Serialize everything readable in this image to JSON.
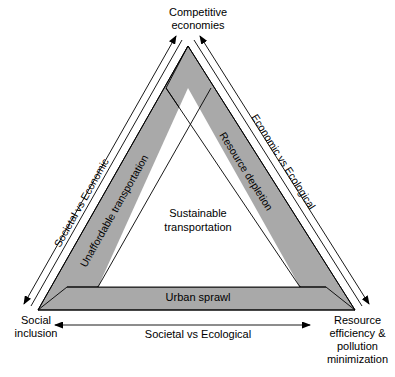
{
  "figure": {
    "type": "diagram",
    "subtype": "sustainability-triangle",
    "background_color": "#ffffff",
    "band_fill_color": "#a9a9a9",
    "line_color": "#000000"
  },
  "corners": {
    "top": {
      "name": "competitive-economies",
      "label": "Competitive\neconomies"
    },
    "bottom_left": {
      "name": "social-inclusion",
      "label": "Social\ninclusion"
    },
    "bottom_right": {
      "name": "resource-efficiency",
      "label": "Resource\nefficiency &\npollution\nminimization"
    }
  },
  "axes": [
    {
      "name": "societal-vs-economic",
      "label": "Societal vs Economic",
      "position": "left-outside",
      "arrow": "double"
    },
    {
      "name": "economic-vs-ecological",
      "label": "Economic vs Ecological",
      "position": "right-outside",
      "arrow": "double"
    },
    {
      "name": "societal-vs-ecological",
      "label": "Societal vs Ecological",
      "position": "bottom-outside",
      "arrow": "double"
    }
  ],
  "bands": [
    {
      "name": "unaffordable-transportation",
      "label": "Unaffordable transportation",
      "edge": "left"
    },
    {
      "name": "resource-depletion",
      "label": "Resource depletion",
      "edge": "right"
    },
    {
      "name": "urban-sprawl",
      "label": "Urban sprawl",
      "edge": "bottom"
    }
  ],
  "center": {
    "name": "sustainable-transportation",
    "label": "Sustainable\ntransportation"
  }
}
